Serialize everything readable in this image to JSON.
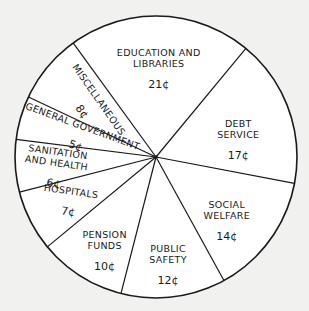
{
  "chart_data": {
    "type": "pie",
    "title": "",
    "unit": "cents per dollar",
    "start_angle_deg": -126,
    "direction": "clockwise",
    "slices": [
      {
        "label": "EDUCATION AND LIBRARIES",
        "lines": [
          "EDUCATION AND",
          "LIBRARIES"
        ],
        "value": 21,
        "value_label": "21¢"
      },
      {
        "label": "DEBT SERVICE",
        "lines": [
          "DEBT",
          "SERVICE"
        ],
        "value": 17,
        "value_label": "17¢"
      },
      {
        "label": "SOCIAL WELFARE",
        "lines": [
          "SOCIAL",
          "WELFARE"
        ],
        "value": 14,
        "value_label": "14¢"
      },
      {
        "label": "PUBLIC SAFETY",
        "lines": [
          "PUBLIC",
          "SAFETY"
        ],
        "value": 12,
        "value_label": "12¢"
      },
      {
        "label": "PENSION FUNDS",
        "lines": [
          "PENSION",
          "FUNDS"
        ],
        "value": 10,
        "value_label": "10¢"
      },
      {
        "label": "HOSPITALS",
        "lines": [
          "HOSPITALS"
        ],
        "value": 7,
        "value_label": "7¢"
      },
      {
        "label": "SANITATION AND HEALTH",
        "lines": [
          "SANITATION",
          "AND HEALTH"
        ],
        "value": 6,
        "value_label": "6¢"
      },
      {
        "label": "GENERAL GOVERNMENT",
        "lines": [
          "GENERAL GOVERNMENT"
        ],
        "value": 5,
        "value_label": "5¢"
      },
      {
        "label": "MISCELLANEOUS",
        "lines": [
          "MISCELLANEOUS"
        ],
        "value": 8,
        "value_label": "8¢"
      }
    ],
    "total": 100,
    "legend": "none (labels inside slices)",
    "colors": {
      "fill": "#ffffff",
      "stroke": "#1a1a1a",
      "background": "#f1f1ef"
    }
  }
}
